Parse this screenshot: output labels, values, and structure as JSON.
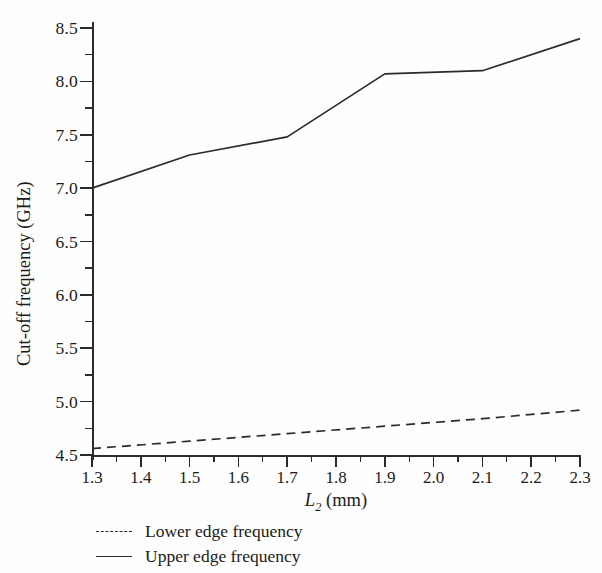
{
  "chart_data": {
    "type": "line",
    "title": "",
    "xlabel": "L2 (mm)",
    "xlabel_base": "L",
    "xlabel_sub": "2",
    "xlabel_unit": "(mm)",
    "ylabel": "Cut-off frequency (GHz)",
    "xlim": [
      1.3,
      2.3
    ],
    "ylim": [
      4.5,
      8.5
    ],
    "grid": false,
    "legend_position": "below-axes-left",
    "x_ticks": [
      "1.3",
      "1.4",
      "1.5",
      "1.6",
      "1.7",
      "1.8",
      "1.9",
      "2.0",
      "2.1",
      "2.2",
      "2.3"
    ],
    "x_tick_values": [
      1.3,
      1.4,
      1.5,
      1.6,
      1.7,
      1.8,
      1.9,
      2.0,
      2.1,
      2.2,
      2.3
    ],
    "x_minor_step": 0.05,
    "y_ticks": [
      "4.5",
      "5.0",
      "5.5",
      "6.0",
      "6.5",
      "7.0",
      "7.5",
      "8.0",
      "8.5"
    ],
    "y_tick_values": [
      4.5,
      5.0,
      5.5,
      6.0,
      6.5,
      7.0,
      7.5,
      8.0,
      8.5
    ],
    "y_minor_step": 0.25,
    "x": [
      1.3,
      1.5,
      1.7,
      1.9,
      2.1,
      2.3
    ],
    "series": [
      {
        "name": "Lower edge frequency",
        "style": "dashed",
        "color": "#2b2b2b",
        "values": [
          4.56,
          4.63,
          4.7,
          4.77,
          4.84,
          4.92
        ]
      },
      {
        "name": "Upper edge frequency",
        "style": "solid",
        "color": "#2b2b2b",
        "values": [
          7.0,
          7.31,
          7.48,
          8.07,
          8.1,
          8.4
        ]
      }
    ]
  },
  "legend": {
    "items": [
      {
        "label": "Lower edge frequency",
        "style": "dashed"
      },
      {
        "label": "Upper edge frequency",
        "style": "solid"
      }
    ]
  }
}
